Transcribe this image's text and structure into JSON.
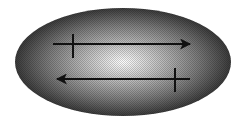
{
  "diagram": {
    "shape": "ellipse",
    "ellipse": {
      "cx": 123,
      "cy": 62,
      "rx": 108,
      "ry": 54,
      "gradient": {
        "center_color": "#ffffff",
        "mid_color": "#9a9a9a",
        "edge_color": "#3a3a3a"
      }
    },
    "arrows": [
      {
        "name": "top-arrow",
        "direction": "right",
        "x1": 53,
        "x2": 192,
        "y": 44,
        "tick_x": 73,
        "tick_y1": 34,
        "tick_y2": 58
      },
      {
        "name": "bottom-arrow",
        "direction": "left",
        "x1": 190,
        "x2": 55,
        "y": 79,
        "tick_x": 175,
        "tick_y1": 68,
        "tick_y2": 92
      }
    ],
    "stroke_color": "#111111"
  }
}
